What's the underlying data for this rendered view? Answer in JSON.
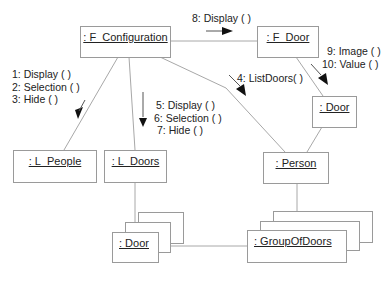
{
  "diagram": {
    "type": "UML collaboration diagram",
    "objects": [
      {
        "id": "f_configuration",
        "label": ": F_Configuration"
      },
      {
        "id": "f_door",
        "label": ": F_Door"
      },
      {
        "id": "door_single",
        "label": ": Door"
      },
      {
        "id": "l_people",
        "label": ": L_People"
      },
      {
        "id": "l_doors",
        "label": ": L_Doors"
      },
      {
        "id": "person",
        "label": ": Person"
      },
      {
        "id": "door_multi",
        "label": ": Door"
      },
      {
        "id": "group_of_doors",
        "label": ": GroupOfDoors"
      }
    ],
    "links": [
      {
        "from": "f_configuration",
        "to": "f_door"
      },
      {
        "from": "f_configuration",
        "to": "l_people"
      },
      {
        "from": "f_configuration",
        "to": "l_doors"
      },
      {
        "from": "f_configuration",
        "to": "person"
      },
      {
        "from": "f_door",
        "to": "door_single"
      },
      {
        "from": "door_single",
        "to": "person"
      },
      {
        "from": "l_doors",
        "to": "door_multi"
      },
      {
        "from": "person",
        "to": "group_of_doors"
      },
      {
        "from": "door_multi",
        "to": "group_of_doors"
      }
    ],
    "messages": {
      "to_l_people": [
        "1: Display ( )",
        "2: Selection ( )",
        "3: Hide ( )"
      ],
      "to_person": [
        "4: ListDoors( )"
      ],
      "to_l_doors": [
        "5: Display ( )",
        "6: Selection ( )",
        "7: Hide ( )"
      ],
      "to_f_door": [
        "8: Display ( )"
      ],
      "to_door": [
        "9: Image ( )",
        "10: Value ( )"
      ]
    }
  }
}
